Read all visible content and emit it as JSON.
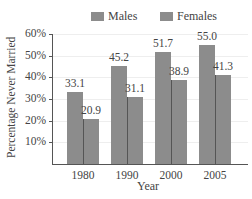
{
  "chart_data": {
    "type": "bar",
    "title": "",
    "xlabel": "Year",
    "ylabel": "Percentage Never Married",
    "categories": [
      "1980",
      "1990",
      "2000",
      "2005"
    ],
    "series": [
      {
        "name": "Males",
        "values": [
          33.1,
          45.2,
          51.7,
          55.0
        ],
        "labels": [
          "33.1",
          "45.2",
          "51.7",
          "55.0"
        ],
        "color": "#8c8c8c"
      },
      {
        "name": "Females",
        "values": [
          20.9,
          31.1,
          38.9,
          41.3
        ],
        "labels": [
          "20.9",
          "31.1",
          "38.9",
          "41.3"
        ],
        "color": "#8c8c8c"
      }
    ],
    "yticks": [
      "10%",
      "20%",
      "30%",
      "40%",
      "50%",
      "60%"
    ],
    "ylim": [
      0,
      60
    ],
    "grid": true,
    "legend_position": "top"
  },
  "legend": {
    "males": "Males",
    "females": "Females"
  },
  "axes": {
    "xlabel": "Year",
    "ylabel": "Percentage Never Married"
  }
}
